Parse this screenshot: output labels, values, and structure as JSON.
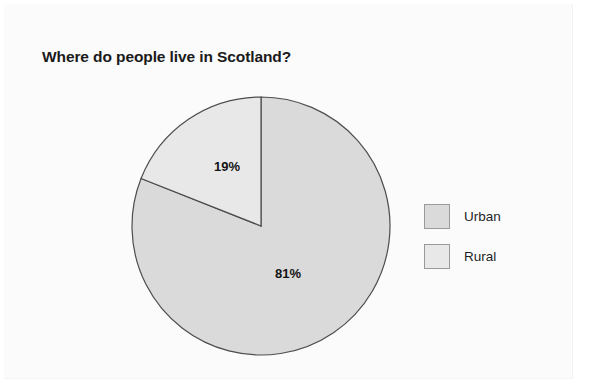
{
  "page": {
    "background_color": "#ffffff",
    "panel_color": "#fbfbfb"
  },
  "chart_data": {
    "type": "pie",
    "title": "Where do people live in Scotland?",
    "xlabel": "",
    "ylabel": "",
    "categories": [
      "Urban",
      "Rural"
    ],
    "values": [
      81,
      19
    ],
    "value_labels": [
      "81%",
      "19%"
    ],
    "unit": "%",
    "start_angle_deg": 0,
    "direction": "clockwise",
    "legend_position": "right",
    "grid": false,
    "colors": [
      "#dadada",
      "#e8e8e8"
    ],
    "stroke_color": "#4d4d4d",
    "series": [
      {
        "name": "Share of population",
        "points": [
          {
            "label": "Urban",
            "value": 81,
            "display": "81%",
            "color": "#dadada"
          },
          {
            "label": "Rural",
            "value": 19,
            "display": "19%",
            "color": "#e8e8e8"
          }
        ]
      }
    ]
  },
  "legend": {
    "items": [
      {
        "label": "Urban",
        "color": "#dadada"
      },
      {
        "label": "Rural",
        "color": "#e8e8e8"
      }
    ]
  },
  "labels": {
    "urban_pct": "81%",
    "rural_pct": "19%"
  }
}
